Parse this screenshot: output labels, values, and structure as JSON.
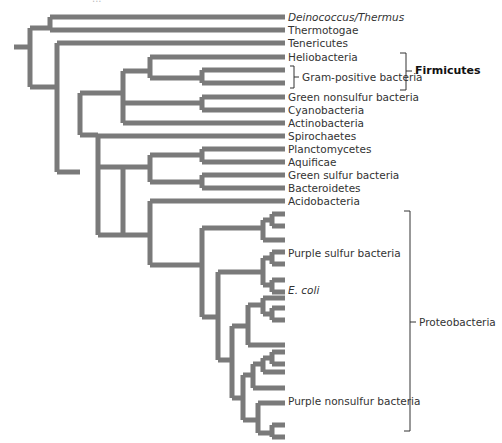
{
  "figure": {
    "title_fragment": "...",
    "branch_color": "#7a7a7a",
    "bracket_color": "#333333"
  },
  "taxa": [
    {
      "label": "Deinococcus/Thermus",
      "italic": true,
      "y": 17
    },
    {
      "label": "Thermotogae",
      "y": 30
    },
    {
      "label": "Tenericutes",
      "y": 43
    },
    {
      "label": "Heliobacteria",
      "y": 57
    },
    {
      "label": "",
      "y": 70
    },
    {
      "label": "",
      "y": 83
    },
    {
      "label": "Green nonsulfur bacteria",
      "y": 97
    },
    {
      "label": "Cyanobacteria",
      "y": 110
    },
    {
      "label": "Actinobacteria",
      "y": 123
    },
    {
      "label": "Spirochaetes",
      "y": 136
    },
    {
      "label": "Planctomycetes",
      "y": 149
    },
    {
      "label": "Aquificae",
      "y": 162
    },
    {
      "label": "Green sulfur bacteria",
      "y": 175
    },
    {
      "label": "Bacteroidetes",
      "y": 188
    },
    {
      "label": "Acidobacteria",
      "y": 201
    },
    {
      "label": "Purple sulfur bacteria",
      "y": 253
    },
    {
      "label": "E. coli",
      "italic": true,
      "y": 290
    },
    {
      "label": "Purple nonsulfur bacteria",
      "y": 401
    }
  ],
  "groups": {
    "gram_positive": "Gram-positive bacteria",
    "firmicutes": "Firmicutes",
    "proteobacteria": "Proteobacteria"
  },
  "branches": [
    "M14 47 H30",
    "M30 28 V87",
    "M30 28 H50 M50 17 V30 M50 17 H285 M50 30 H285",
    "M30 87 H57",
    "M57 43 V172 M57 43 H285",
    "M57 172 H80",
    "M80 93 V135 M80 93 H123 M123 71 V123 M123 71 H150 M150 57 V78 M150 57 H285 M150 78 H202 M202 70 V83 M202 70 H285 M202 83 H285",
    "M123 123 H285 M150 123 H150",
    "M123 103 H202 M202 97 V110 M202 97 H285 M202 110 H285",
    "M80 135 H98",
    "M98 136 V235 M98 136 H285",
    "M98 167 H123 M123 167 V235",
    "M98 235 H123",
    "M123 167 H150 M150 155 V182 M150 155 H202 M202 149 V162 M202 149 H285 M202 162 H285 M150 182 H202 M202 175 V188 M202 175 H285 M202 188 H285",
    "M123 235 H150 M150 201 V265 M150 201 H285",
    "M150 265 H202",
    "M202 228 V317 M202 228 H263",
    "M263 220 V240 M263 220 H272 M272 214 V226 M272 214 H285 M272 226 H285 M263 240 H285",
    "M202 317 H218 M218 272 V360",
    "M218 272 H263 M263 258 V285 M263 258 H272 M272 252 V264 M272 252 H285 M272 264 H285 M263 285 H272 M272 280 V292 M272 280 H285 M272 292 H285",
    "M218 360 H232 M232 326 V398",
    "M232 326 H248 M248 305 V345 M248 305 H263 M263 298 V314 M263 298 H285 M263 314 H272 M272 308 V320 M272 308 H285 M272 320 H285 M248 345 H285",
    "M232 398 H243 M243 375 V420",
    "M243 375 H253 M253 364 V388 M253 364 H263 M263 358 V372 M263 358 H272 M272 352 V364 M272 352 H285 M272 364 H285 M263 372 H285 M253 388 H285",
    "M243 420 H258 M258 403 V433 M258 403 H285 M258 433 H272 M272 425 V437 M272 425 H285 M272 437 H285"
  ]
}
